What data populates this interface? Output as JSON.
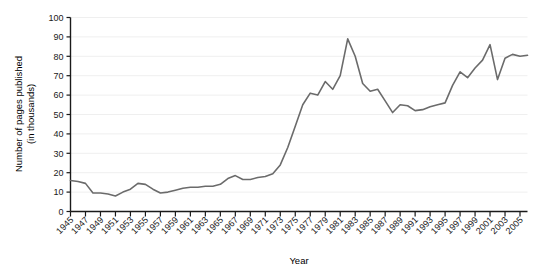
{
  "chart_data": {
    "type": "line",
    "title": "",
    "xlabel": "Year",
    "ylabel": "Number of pages published\n(in thousands)",
    "ylabel_line1": "Number of pages published",
    "ylabel_line2": "(in thousands)",
    "ylim": [
      0,
      100
    ],
    "xlim": [
      1945,
      2006
    ],
    "ytick_labels": [
      "0",
      "10",
      "20",
      "30",
      "40",
      "50",
      "60",
      "70",
      "80",
      "90",
      "100"
    ],
    "yticks": [
      0,
      10,
      20,
      30,
      40,
      50,
      60,
      70,
      80,
      90,
      100
    ],
    "xtick_labels": [
      "1945",
      "1947",
      "1949",
      "1951",
      "1953",
      "1955",
      "1957",
      "1959",
      "1961",
      "1963",
      "1965",
      "1967",
      "1969",
      "1971",
      "1973",
      "1975",
      "1977",
      "1979",
      "1981",
      "1983",
      "1985",
      "1987",
      "1989",
      "1991",
      "1993",
      "1995",
      "1997",
      "1999",
      "2001",
      "2003",
      "2005"
    ],
    "xticks": [
      1945,
      1947,
      1949,
      1951,
      1953,
      1955,
      1957,
      1959,
      1961,
      1963,
      1965,
      1967,
      1969,
      1971,
      1973,
      1975,
      1977,
      1979,
      1981,
      1983,
      1985,
      1987,
      1989,
      1991,
      1993,
      1995,
      1997,
      1999,
      2001,
      2003,
      2005
    ],
    "grid": true,
    "grid_axis": "y",
    "legend": "none",
    "line_color": "#6b6b6b",
    "grid_color": "#efefef",
    "axis_color": "#1a1a1a",
    "x": [
      1945,
      1946,
      1947,
      1948,
      1949,
      1950,
      1951,
      1952,
      1953,
      1954,
      1955,
      1956,
      1957,
      1958,
      1959,
      1960,
      1961,
      1962,
      1963,
      1964,
      1965,
      1966,
      1967,
      1968,
      1969,
      1970,
      1971,
      1972,
      1973,
      1974,
      1975,
      1976,
      1977,
      1978,
      1979,
      1980,
      1981,
      1982,
      1983,
      1984,
      1985,
      1986,
      1987,
      1988,
      1989,
      1990,
      1991,
      1992,
      1993,
      1994,
      1995,
      1996,
      1997,
      1998,
      1999,
      2000,
      2001,
      2002,
      2003,
      2004,
      2005,
      2006
    ],
    "values": [
      16,
      15.5,
      14.5,
      9.5,
      9.5,
      9,
      8,
      10,
      11.5,
      14.5,
      14,
      11.5,
      9.5,
      10,
      11,
      12,
      12.5,
      12.5,
      13,
      13,
      14,
      17,
      18.5,
      16.5,
      16.5,
      17.5,
      18,
      19.5,
      24,
      33,
      44,
      55,
      61,
      60,
      67,
      63,
      70,
      89,
      80,
      66,
      62,
      63,
      57,
      51,
      55,
      54.5,
      52,
      52.5,
      54,
      55,
      56,
      65,
      72,
      69,
      74,
      78,
      86,
      68,
      79,
      81,
      80,
      80.5
    ],
    "series": [
      {
        "name": "Number of pages published",
        "values": [
          16,
          15.5,
          14.5,
          9.5,
          9.5,
          9,
          8,
          10,
          11.5,
          14.5,
          14,
          11.5,
          9.5,
          10,
          11,
          12,
          12.5,
          12.5,
          13,
          13,
          14,
          17,
          18.5,
          16.5,
          16.5,
          17.5,
          18,
          19.5,
          24,
          33,
          44,
          55,
          61,
          60,
          67,
          63,
          70,
          89,
          80,
          66,
          62,
          63,
          57,
          51,
          55,
          54.5,
          52,
          52.5,
          54,
          55,
          56,
          65,
          72,
          69,
          74,
          78,
          86,
          68,
          79,
          81,
          80,
          80.5
        ]
      }
    ]
  }
}
